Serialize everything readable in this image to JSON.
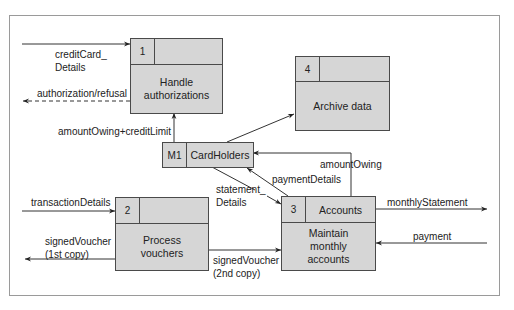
{
  "processes": [
    {
      "id": "1",
      "name": "Handle authorizations",
      "line1": "Handle",
      "line2": "authorizations"
    },
    {
      "id": "2",
      "name": "Process vouchers",
      "line1": "Process",
      "line2": "vouchers"
    },
    {
      "id": "3",
      "store": "Accounts",
      "line1": "Maintain",
      "line2": "monthly",
      "line3": "accounts"
    },
    {
      "id": "4",
      "name": "Archive data"
    }
  ],
  "datastore": {
    "id": "M1",
    "name": "CardHolders"
  },
  "flows": {
    "creditCard_line1": "creditCard_",
    "creditCard_line2": "Details",
    "authorization": "authorization/refusal",
    "amountOwingCredit": "amountOwing+creditLimit",
    "amountOwing": "amountOwing",
    "paymentDetails": "paymentDetails",
    "statement_line1": "statement_",
    "statement_line2": "Details",
    "transactionDetails": "transactionDetails",
    "signedVoucher1_line1": "signedVoucher",
    "signedVoucher1_line2": "(1st copy)",
    "signedVoucher2_line1": "signedVoucher",
    "signedVoucher2_line2": "(2nd copy)",
    "monthlyStatement": "monthlyStatement",
    "payment": "payment"
  },
  "colors": {
    "box_fill": "#d6d6d6",
    "border": "#4a4a4a",
    "frame": "#9a9a9a"
  }
}
